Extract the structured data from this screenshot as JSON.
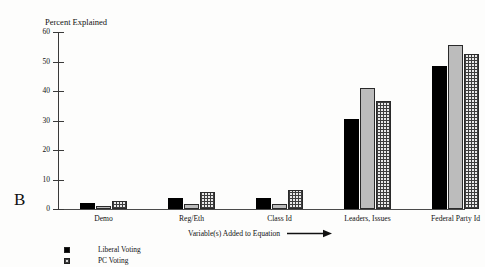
{
  "panel": {
    "letter": "B"
  },
  "chart_data": {
    "type": "bar",
    "title": "",
    "ylabel": "Percent Explained",
    "xlabel": "Variable(s) Added to Equation",
    "xlabel_arrow": "right-arrow",
    "ylim": [
      0,
      60
    ],
    "yticks": [
      0,
      10,
      20,
      30,
      40,
      50,
      60
    ],
    "ytick_labels": [
      "0",
      "10",
      "20",
      "30",
      "40",
      "50",
      "60"
    ],
    "grid": false,
    "legend_position": "bottom-left",
    "categories": [
      "Demo",
      "Reg/Eth",
      "Class Id",
      "Leaders, Issues",
      "Federal Party Id"
    ],
    "series": [
      {
        "name": "Liberal Voting",
        "pattern": "solid-black",
        "values": [
          2.0,
          3.8,
          3.8,
          30.5,
          48.5
        ]
      },
      {
        "name": "PC Voting",
        "pattern": "gray-stipple",
        "values": [
          1.0,
          1.6,
          1.6,
          41.0,
          55.5
        ]
      },
      {
        "name": "",
        "pattern": "cross-hatch",
        "values": [
          2.8,
          5.8,
          6.6,
          36.5,
          52.5
        ]
      }
    ]
  },
  "legend": {
    "items": [
      {
        "label": "Liberal Voting",
        "swatch": "solid-black"
      },
      {
        "label": "PC Voting",
        "swatch": "cross-hatch"
      }
    ]
  },
  "colors": {
    "axis": "#3a3a3a",
    "series_solid": "#000000",
    "series_stipple": "#bcbcbc",
    "series_hatch": "#e9e9e9",
    "text": "#111111",
    "background": "#fdfdfc"
  }
}
